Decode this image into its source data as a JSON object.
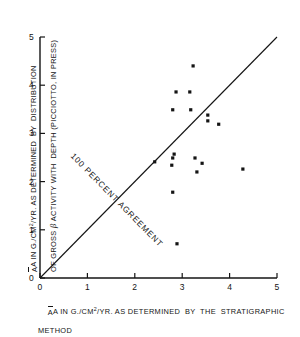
{
  "figure": {
    "kind": "scatter-plot-with-reference-line"
  },
  "axes": {
    "x": {
      "label_line1_pre": "A IN G./CM",
      "label_line1_sup": "2",
      "label_line1_post": "/YR. AS DETERMINED  BY  THE  STRATIGRAPHIC",
      "label_line2": "METHOD",
      "ticks": [
        "0",
        "1",
        "2",
        "3",
        "4",
        "5"
      ],
      "min": 0,
      "max": 5
    },
    "y": {
      "label_line1_pre": "A IN G./CM",
      "label_line1_sup": "2",
      "label_line1_post": "/YR. AS DETERMINED  BY  DISTRIBUTION",
      "label_line2_pre": "OF GROSS ",
      "label_line2_beta": "β",
      "label_line2_post": " ACTIVITY WITH  DEPTH (PICCIOTTO, IN PRESS)",
      "ticks": [
        "0",
        "1",
        "2",
        "3",
        "4",
        "5"
      ],
      "min": 0,
      "max": 5
    }
  },
  "annotations": {
    "reference_line_label": "100 PERCENT  AGREEMENT"
  },
  "colors": {
    "ink": "#141414",
    "background": "#ffffff"
  },
  "chart_data": {
    "type": "scatter",
    "title": "",
    "xlabel": "A IN G./CM2/YR. AS DETERMINED BY THE STRATIGRAPHIC METHOD",
    "ylabel": "A IN G./CM2/YR. AS DETERMINED BY DISTRIBUTION OF GROSS β ACTIVITY WITH DEPTH (PICCIOTTO, IN PRESS)",
    "xlim": [
      0,
      5
    ],
    "ylim": [
      0,
      5
    ],
    "xticks": [
      0,
      1,
      2,
      3,
      4,
      5
    ],
    "yticks": [
      0,
      1,
      2,
      3,
      4,
      5
    ],
    "grid": false,
    "legend": false,
    "points": [
      {
        "x": 3.23,
        "y": 4.4
      },
      {
        "x": 2.87,
        "y": 3.86
      },
      {
        "x": 3.16,
        "y": 3.86
      },
      {
        "x": 2.8,
        "y": 3.49
      },
      {
        "x": 3.18,
        "y": 3.49
      },
      {
        "x": 3.54,
        "y": 3.38
      },
      {
        "x": 3.54,
        "y": 3.26
      },
      {
        "x": 3.77,
        "y": 3.19
      },
      {
        "x": 2.83,
        "y": 2.57
      },
      {
        "x": 2.8,
        "y": 2.49
      },
      {
        "x": 3.27,
        "y": 2.49
      },
      {
        "x": 2.42,
        "y": 2.41
      },
      {
        "x": 3.42,
        "y": 2.38
      },
      {
        "x": 2.78,
        "y": 2.34
      },
      {
        "x": 4.28,
        "y": 2.26
      },
      {
        "x": 3.31,
        "y": 2.2
      },
      {
        "x": 2.8,
        "y": 1.78
      },
      {
        "x": 2.89,
        "y": 0.71
      }
    ],
    "reference_line": {
      "label": "100 PERCENT AGREEMENT",
      "from": [
        0,
        0
      ],
      "to": [
        5,
        5
      ],
      "slope": 1,
      "intercept": 0
    }
  }
}
